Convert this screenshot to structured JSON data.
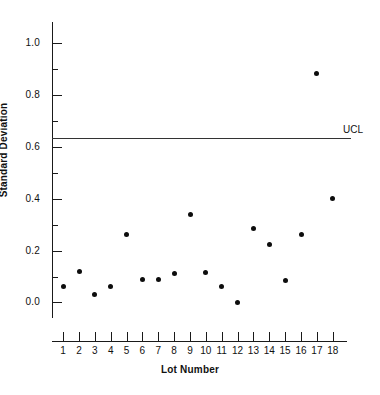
{
  "chart_data": {
    "type": "scatter",
    "title": "",
    "xlabel": "Lot Number",
    "ylabel": "Standard Deviation",
    "x": [
      1,
      2,
      3,
      4,
      5,
      6,
      7,
      8,
      9,
      10,
      11,
      12,
      13,
      14,
      15,
      16,
      17,
      18
    ],
    "categories": [
      "1",
      "2",
      "3",
      "4",
      "5",
      "6",
      "7",
      "8",
      "9",
      "10",
      "11",
      "12",
      "13",
      "14",
      "15",
      "16",
      "17",
      "18"
    ],
    "values": [
      0.06,
      0.12,
      0.03,
      0.06,
      0.26,
      0.09,
      0.09,
      0.11,
      0.34,
      0.115,
      0.06,
      0.0,
      0.285,
      0.225,
      0.085,
      0.26,
      0.88,
      0.4
    ],
    "series": [
      {
        "name": "Standard Deviation",
        "values": [
          0.06,
          0.12,
          0.03,
          0.06,
          0.26,
          0.09,
          0.09,
          0.11,
          0.34,
          0.115,
          0.06,
          0.0,
          0.285,
          0.225,
          0.085,
          0.26,
          0.88,
          0.4
        ]
      }
    ],
    "ylim": [
      -0.06,
      1.08
    ],
    "xlim": [
      0.3,
      18.9
    ],
    "ytick_labels": [
      "1.0",
      "0.8",
      "0.6",
      "0.4",
      "0.2",
      "0.0"
    ],
    "ytick_values": [
      1.0,
      0.8,
      0.6,
      0.4,
      0.2,
      0.0
    ],
    "yminor_values": [
      0.9,
      0.7,
      0.5,
      0.3,
      0.1
    ],
    "xtick_labels": [
      "1",
      "2",
      "3",
      "4",
      "5",
      "6",
      "7",
      "8",
      "9",
      "10",
      "11",
      "12",
      "13",
      "14",
      "15",
      "16",
      "17",
      "18"
    ],
    "grid": false,
    "legend": "none",
    "annotations": [
      {
        "name": "UCL",
        "label": "UCL",
        "type": "hline",
        "value": 0.635
      }
    ],
    "marker_color": "#0d0d0d",
    "axis_color": "#1a1a1a",
    "ucl_color": "#333333"
  }
}
